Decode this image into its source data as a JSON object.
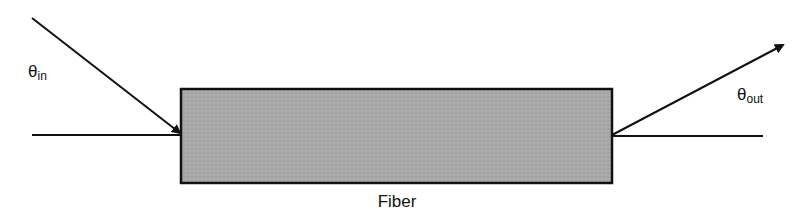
{
  "diagram": {
    "fiber_label": "Fiber",
    "theta_in": {
      "symbol": "θ",
      "subscript": "in"
    },
    "theta_out": {
      "symbol": "θ",
      "subscript": "out"
    },
    "colors": {
      "line": "#111111",
      "fiber_fill": "#a9a9a9",
      "fiber_border": "#111111",
      "background": "#ffffff"
    }
  }
}
